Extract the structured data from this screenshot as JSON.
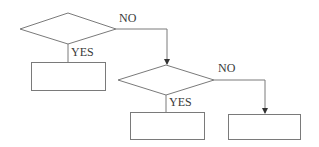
{
  "diagram": {
    "type": "flowchart",
    "stroke_color": "#6b6b6b",
    "text_color": "#3a3a3a",
    "nodes": [
      {
        "id": "decision-1",
        "shape": "diamond",
        "text": "",
        "cx": 68,
        "cy": 29,
        "w": 96,
        "h": 31
      },
      {
        "id": "process-1",
        "shape": "rect",
        "text": "",
        "x": 31,
        "y": 62,
        "w": 74,
        "h": 28
      },
      {
        "id": "decision-2",
        "shape": "diamond",
        "text": "",
        "cx": 166,
        "cy": 80,
        "w": 96,
        "h": 31
      },
      {
        "id": "process-2",
        "shape": "rect",
        "text": "",
        "x": 130,
        "y": 112,
        "w": 74,
        "h": 27
      },
      {
        "id": "process-3",
        "shape": "rect",
        "text": "",
        "x": 228,
        "y": 114,
        "w": 72,
        "h": 25
      }
    ],
    "edges": [
      {
        "from": "decision-1",
        "to": "process-1",
        "label": "YES"
      },
      {
        "from": "decision-1",
        "to": "decision-2",
        "label": "NO"
      },
      {
        "from": "decision-2",
        "to": "process-2",
        "label": "YES"
      },
      {
        "from": "decision-2",
        "to": "process-3",
        "label": "NO"
      }
    ]
  },
  "labels": {
    "no_1": "NO",
    "yes_1": "YES",
    "no_2": "NO",
    "yes_2": "YES"
  }
}
